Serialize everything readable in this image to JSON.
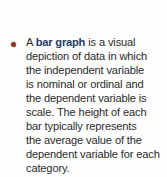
{
  "callout": {
    "bullet": {
      "icon": "bullet-dot-icon",
      "color": "#8c3a27"
    },
    "term": "bar graph",
    "term_color": "#1d3b66",
    "body_color": "#2b2b2b",
    "background_color": "#fefefe",
    "full_text": "A bar graph is a visual depiction of data in which the independent variable is nominal or ordinal and the dependent variable is scale. The height of each bar typically represents the average value of the dependent variable for each category.",
    "lines": [
      {
        "prefix": "A ",
        "term": "bar graph",
        "suffix": " is a visual"
      },
      {
        "prefix": "depiction of data in which",
        "term": "",
        "suffix": ""
      },
      {
        "prefix": "the independent variable",
        "term": "",
        "suffix": ""
      },
      {
        "prefix": "is nominal or ordinal and",
        "term": "",
        "suffix": ""
      },
      {
        "prefix": "the dependent variable is",
        "term": "",
        "suffix": ""
      },
      {
        "prefix": "scale. The height of each",
        "term": "",
        "suffix": ""
      },
      {
        "prefix": "bar typically represents",
        "term": "",
        "suffix": ""
      },
      {
        "prefix": "the average value of the",
        "term": "",
        "suffix": ""
      },
      {
        "prefix": "dependent variable for each",
        "term": "",
        "suffix": ""
      },
      {
        "prefix": "category.",
        "term": "",
        "suffix": ""
      }
    ]
  }
}
